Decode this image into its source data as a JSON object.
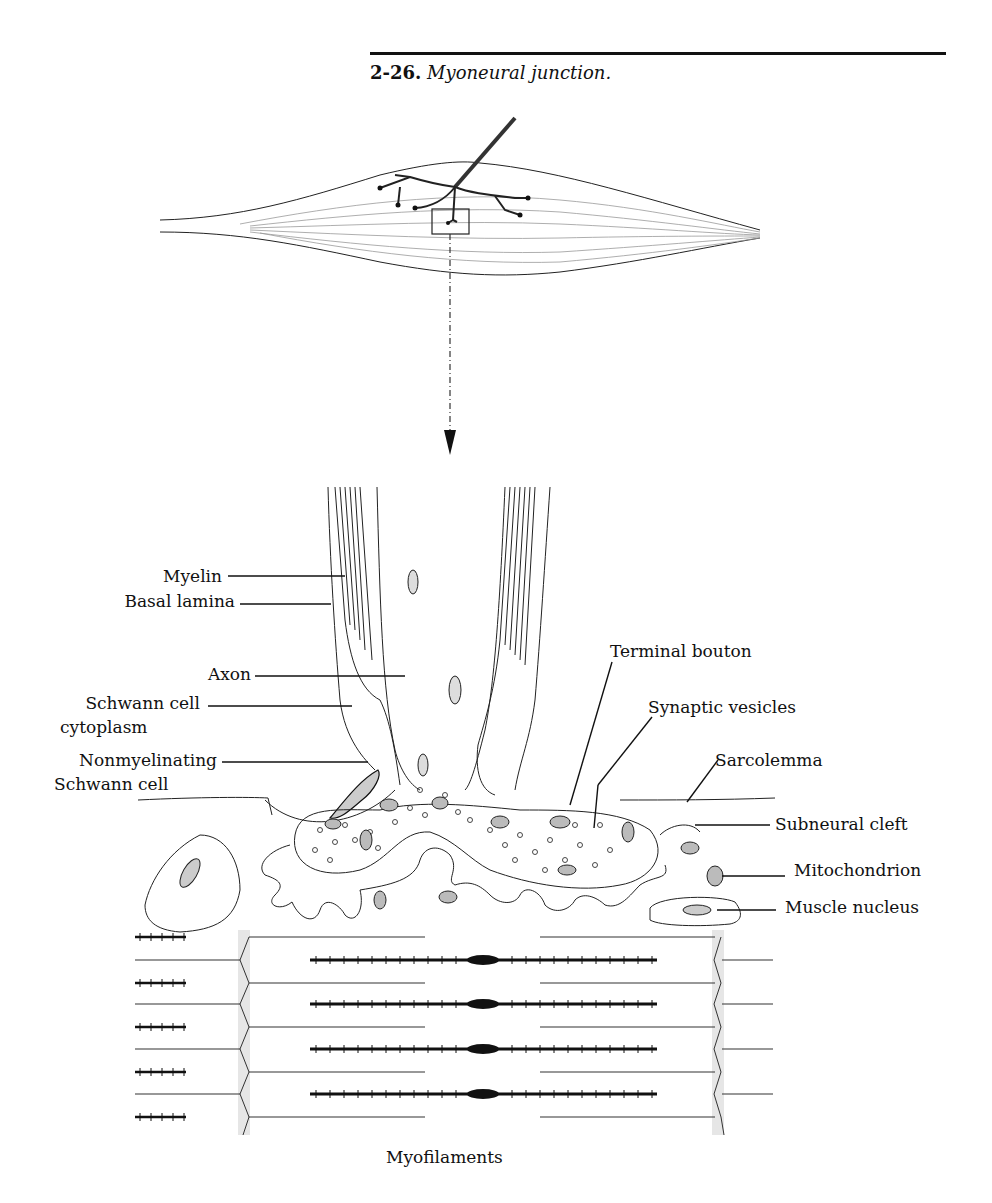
{
  "figure": {
    "number": "2-26.",
    "title": "Myoneural junction."
  },
  "labels": {
    "myelin": "Myelin",
    "basal_lamina": "Basal lamina",
    "axon": "Axon",
    "schwann_cytoplasm_1": "Schwann cell",
    "schwann_cytoplasm_2": "cytoplasm",
    "nonmyelinating_1": "Nonmyelinating",
    "nonmyelinating_2": "Schwann cell",
    "terminal_bouton": "Terminal bouton",
    "synaptic_vesicles": "Synaptic vesicles",
    "sarcolemma": "Sarcolemma",
    "subneural_cleft": "Subneural cleft",
    "mitochondrion": "Mitochondrion",
    "muscle_nucleus": "Muscle nucleus",
    "myofilaments": "Myofilaments"
  }
}
